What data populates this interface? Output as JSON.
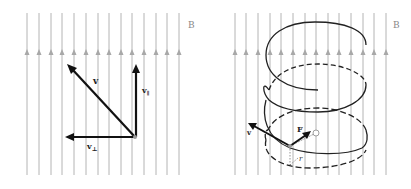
{
  "figure": {
    "left_panel": {
      "field_label": "B",
      "vectors": {
        "velocity": "v",
        "parallel": "v",
        "parallel_sub": "∥",
        "perpendicular": "v",
        "perpendicular_sub": "⊥"
      }
    },
    "right_panel": {
      "field_label": "B",
      "labels": {
        "velocity": "v",
        "force": "F",
        "radius": "r"
      }
    },
    "colors": {
      "field_lines": "#b4b4b4",
      "vectors": "#111111",
      "helix": "#222222",
      "background": "#ffffff"
    }
  }
}
